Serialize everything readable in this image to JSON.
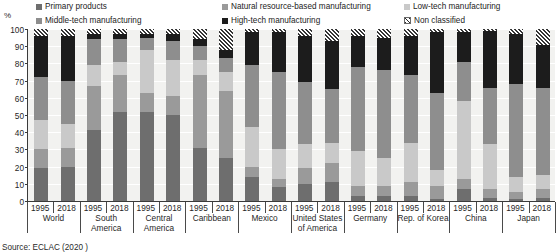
{
  "axis": {
    "y_unit": "%",
    "y_ticks": [
      100,
      90,
      80,
      70,
      60,
      50,
      40,
      30,
      20,
      10,
      0
    ]
  },
  "legend": {
    "items": [
      {
        "label": "Primary products",
        "color": "#6e6e6e",
        "style": "solid"
      },
      {
        "label": "Natural resource-based manufacturing",
        "color": "#9a9a9a",
        "style": "solid"
      },
      {
        "label": "Low-tech manufacturing",
        "color": "#c9c9c9",
        "style": "solid"
      },
      {
        "label": "Middle-tech manufacturing",
        "color": "#8e8e8e",
        "style": "solid"
      },
      {
        "label": "High-tech manufacturing",
        "color": "#1c1c1c",
        "style": "solid"
      },
      {
        "label": "Non classified",
        "color": "#2b2b2b",
        "style": "hatch"
      }
    ]
  },
  "source": {
    "text": "Source: ECLAC (2020 )"
  },
  "chart_data": {
    "type": "bar",
    "stacked": true,
    "title": "",
    "xlabel": "",
    "ylabel": "%",
    "ylim": [
      0,
      100
    ],
    "grid": true,
    "legend_position": "top",
    "groups": [
      {
        "name": "World",
        "years": [
          "1995",
          "2018"
        ]
      },
      {
        "name": "South America",
        "years": [
          "1995",
          "2018"
        ]
      },
      {
        "name": "Central America",
        "years": [
          "1995",
          "2018"
        ]
      },
      {
        "name": "Caribbean",
        "years": [
          "1995",
          "2018"
        ]
      },
      {
        "name": "Mexico",
        "years": [
          "1995",
          "2018"
        ]
      },
      {
        "name": "United States of America",
        "years": [
          "1995",
          "2018"
        ]
      },
      {
        "name": "Germany",
        "years": [
          "1995",
          "2018"
        ]
      },
      {
        "name": "Rep. of Korea",
        "years": [
          "1995",
          "2018"
        ]
      },
      {
        "name": "China",
        "years": [
          "1995",
          "2018"
        ]
      },
      {
        "name": "Japan",
        "years": [
          "1995",
          "2018"
        ]
      }
    ],
    "series": [
      {
        "name": "Primary products",
        "color": "#6e6e6e"
      },
      {
        "name": "Natural resource-based manufacturing",
        "color": "#9a9a9a"
      },
      {
        "name": "Low-tech manufacturing",
        "color": "#c9c9c9"
      },
      {
        "name": "Middle-tech manufacturing",
        "color": "#8e8e8e"
      },
      {
        "name": "High-tech manufacturing",
        "color": "#1c1c1c"
      },
      {
        "name": "Non classified",
        "color": "#2b2b2b",
        "hatch": true
      }
    ],
    "bars": [
      {
        "group": "World",
        "year": "1995",
        "values": [
          19,
          11,
          17,
          25,
          24,
          4
        ]
      },
      {
        "group": "World",
        "year": "2018",
        "values": [
          20,
          11,
          14,
          25,
          26,
          4
        ]
      },
      {
        "group": "South America",
        "year": "1995",
        "values": [
          41,
          26,
          12,
          15,
          3,
          3
        ]
      },
      {
        "group": "South America",
        "year": "2018",
        "values": [
          52,
          21,
          8,
          13,
          3,
          3
        ]
      },
      {
        "group": "Central America",
        "year": "1995",
        "values": [
          52,
          11,
          25,
          7,
          2,
          3
        ]
      },
      {
        "group": "Central America",
        "year": "2018",
        "values": [
          50,
          11,
          21,
          11,
          4,
          3
        ]
      },
      {
        "group": "Caribbean",
        "year": "1995",
        "values": [
          31,
          42,
          9,
          8,
          4,
          6
        ]
      },
      {
        "group": "Caribbean",
        "year": "2018",
        "values": [
          25,
          39,
          11,
          8,
          5,
          12
        ]
      },
      {
        "group": "Mexico",
        "year": "1995",
        "values": [
          14,
          6,
          23,
          36,
          19,
          2
        ]
      },
      {
        "group": "Mexico",
        "year": "2018",
        "values": [
          8,
          5,
          17,
          45,
          23,
          2
        ]
      },
      {
        "group": "United States of America",
        "year": "1995",
        "values": [
          10,
          9,
          14,
          36,
          27,
          4
        ]
      },
      {
        "group": "United States of America",
        "year": "2018",
        "values": [
          11,
          11,
          12,
          31,
          28,
          7
        ]
      },
      {
        "group": "Germany",
        "year": "1995",
        "values": [
          3,
          6,
          20,
          49,
          18,
          4
        ]
      },
      {
        "group": "Germany",
        "year": "2018",
        "values": [
          3,
          6,
          16,
          51,
          19,
          5
        ]
      },
      {
        "group": "Rep. of Korea",
        "year": "1995",
        "values": [
          3,
          8,
          23,
          39,
          23,
          4
        ]
      },
      {
        "group": "Rep. of Korea",
        "year": "2018",
        "values": [
          1,
          8,
          9,
          45,
          35,
          2
        ]
      },
      {
        "group": "China",
        "year": "1995",
        "values": [
          7,
          6,
          45,
          23,
          17,
          2
        ]
      },
      {
        "group": "China",
        "year": "2018",
        "values": [
          2,
          5,
          26,
          33,
          33,
          1
        ]
      },
      {
        "group": "Japan",
        "year": "1995",
        "values": [
          1,
          4,
          9,
          54,
          29,
          3
        ]
      },
      {
        "group": "Japan",
        "year": "2018",
        "values": [
          2,
          5,
          8,
          51,
          25,
          9
        ]
      }
    ]
  }
}
